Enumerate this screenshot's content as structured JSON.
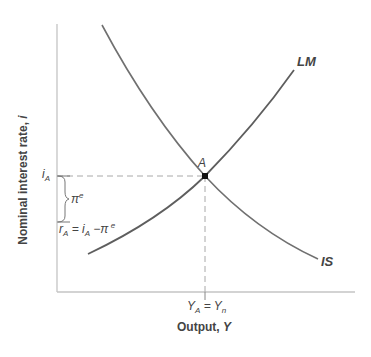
{
  "diagram": {
    "type": "IS-LM",
    "y_axis_label": "Nominal interest rate, ",
    "y_axis_var": "i",
    "x_axis_label": "Output, ",
    "x_axis_var": "Y",
    "curves": {
      "lm_label": "LM",
      "is_label": "IS"
    },
    "equilibrium": {
      "point_label": "A",
      "x_label_main": "Y",
      "x_label_sub": "A",
      "x_label_eq": " = Y",
      "x_label_sub2": "n"
    },
    "y_marks": {
      "i_main": "i",
      "i_sub": "A",
      "pi_main": "π",
      "pi_sup": "e",
      "r_main": "r",
      "r_sub": "A",
      "r_eq": " = i",
      "r_eq_sub": "A",
      "r_minus": " −π",
      "r_sup": " e"
    },
    "colors": {
      "curve": "#6e6e6e",
      "axis": "#bdbdbd",
      "dashed": "#a0a0a0",
      "point": "#111111",
      "text": "#444444"
    }
  }
}
